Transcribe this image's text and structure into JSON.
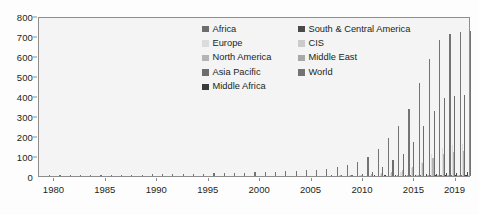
{
  "chart": {
    "type": "bar",
    "background_color": "#f4f4f4",
    "frame_color": "#8d8d8d"
  },
  "axes": {
    "y": {
      "label": "",
      "ticks": [
        "0",
        "100",
        "200",
        "300",
        "400",
        "500",
        "600",
        "700",
        "800"
      ],
      "min": 0,
      "max": 800
    },
    "x": {
      "label": "",
      "ticks": [
        "1980",
        "1985",
        "1990",
        "1995",
        "2000",
        "2005",
        "2010",
        "2015",
        "2019"
      ]
    }
  },
  "legend": {
    "position": "top-center",
    "entries": [
      {
        "label": "Africa",
        "color": "#6d6d6d"
      },
      {
        "label": "Europe",
        "color": "#dcdcdc"
      },
      {
        "label": "North America",
        "color": "#b4b4b4"
      },
      {
        "label": "Asia Pacific",
        "color": "#6d6d6d"
      },
      {
        "label": "Middle Africa",
        "color": "#3a3a3a"
      },
      {
        "label": "South & Central America",
        "color": "#4a4a4a"
      },
      {
        "label": "CIS",
        "color": "#cbcbcb"
      },
      {
        "label": "Middle East",
        "color": "#a8a8a8"
      },
      {
        "label": "World",
        "color": "#737373"
      }
    ]
  },
  "chart_data": {
    "type": "bar",
    "title": "",
    "xlabel": "",
    "ylabel": "",
    "ylim": [
      0,
      800
    ],
    "grid": false,
    "legend_position": "top-center",
    "x": [
      "1979",
      "1980",
      "1981",
      "1982",
      "1983",
      "1984",
      "1985",
      "1986",
      "1987",
      "1988",
      "1989",
      "1990",
      "1991",
      "1992",
      "1993",
      "1994",
      "1995",
      "1996",
      "1997",
      "1998",
      "1999",
      "2000",
      "2001",
      "2002",
      "2003",
      "2004",
      "2005",
      "2006",
      "2007",
      "2008",
      "2009",
      "2010",
      "2011",
      "2012",
      "2013",
      "2014",
      "2015",
      "2016",
      "2017",
      "2018",
      "2019",
      "2020"
    ],
    "categories": [
      "1979",
      "1980",
      "1981",
      "1982",
      "1983",
      "1984",
      "1985",
      "1986",
      "1987",
      "1988",
      "1989",
      "1990",
      "1991",
      "1992",
      "1993",
      "1994",
      "1995",
      "1996",
      "1997",
      "1998",
      "1999",
      "2000",
      "2001",
      "2002",
      "2003",
      "2004",
      "2005",
      "2006",
      "2007",
      "2008",
      "2009",
      "2010",
      "2011",
      "2012",
      "2013",
      "2014",
      "2015",
      "2016",
      "2017",
      "2018",
      "2019",
      "2020"
    ],
    "series": [
      {
        "name": "Africa",
        "color": "#6d6d6d",
        "values": [
          0,
          0,
          0,
          0,
          0,
          0,
          0,
          0,
          0,
          0,
          0,
          0,
          0,
          0,
          0,
          0,
          0,
          0,
          0,
          0,
          0,
          0,
          0,
          0,
          0,
          0,
          0,
          0,
          0,
          0,
          0,
          0,
          0,
          0,
          0,
          0,
          2,
          2,
          3,
          4,
          5,
          5
        ]
      },
      {
        "name": "Europe",
        "color": "#dcdcdc",
        "values": [
          0,
          0,
          0,
          0,
          0,
          0,
          0,
          0,
          0,
          0,
          0,
          0,
          0,
          0,
          0,
          0,
          0,
          0,
          0,
          0,
          0,
          0,
          0,
          0,
          0,
          0,
          0,
          0,
          0,
          1,
          1,
          2,
          4,
          8,
          14,
          22,
          40,
          70,
          110,
          140,
          155,
          160
        ]
      },
      {
        "name": "North America",
        "color": "#b4b4b4",
        "values": [
          0,
          0,
          0,
          0,
          0,
          0,
          0,
          0,
          0,
          0,
          0,
          0,
          0,
          0,
          0,
          0,
          0,
          0,
          0,
          0,
          0,
          0,
          0,
          0,
          0,
          0,
          0,
          0,
          0,
          1,
          2,
          5,
          9,
          14,
          20,
          28,
          45,
          65,
          90,
          110,
          120,
          125
        ]
      },
      {
        "name": "Asia Pacific",
        "color": "#6d6d6d",
        "values": [
          0,
          0,
          0,
          0,
          0,
          0,
          0,
          0,
          0,
          0,
          0,
          0,
          0,
          0,
          0,
          0,
          0,
          0,
          0,
          0,
          0,
          0,
          0,
          0,
          0,
          0,
          0,
          0,
          1,
          2,
          4,
          10,
          22,
          45,
          80,
          110,
          170,
          255,
          330,
          395,
          405,
          410
        ]
      },
      {
        "name": "Middle Africa",
        "color": "#3a3a3a",
        "values": [
          0,
          0,
          0,
          0,
          0,
          0,
          0,
          0,
          0,
          0,
          0,
          0,
          0,
          0,
          0,
          0,
          0,
          0,
          0,
          0,
          0,
          0,
          0,
          0,
          0,
          0,
          0,
          0,
          0,
          0,
          0,
          0,
          0,
          0,
          0,
          0,
          0,
          0,
          1,
          1,
          2,
          2
        ]
      },
      {
        "name": "South & Central America",
        "color": "#4a4a4a",
        "values": [
          0,
          0,
          0,
          0,
          0,
          0,
          0,
          0,
          0,
          0,
          0,
          0,
          0,
          0,
          0,
          0,
          0,
          0,
          0,
          0,
          0,
          0,
          0,
          0,
          0,
          0,
          0,
          0,
          0,
          0,
          0,
          0,
          1,
          2,
          3,
          4,
          6,
          9,
          12,
          15,
          17,
          18
        ]
      },
      {
        "name": "CIS",
        "color": "#cbcbcb",
        "values": [
          0,
          0,
          0,
          0,
          0,
          0,
          0,
          0,
          0,
          0,
          0,
          0,
          0,
          0,
          0,
          0,
          0,
          0,
          0,
          0,
          0,
          0,
          0,
          0,
          0,
          0,
          0,
          0,
          0,
          0,
          0,
          0,
          0,
          0,
          0,
          0,
          1,
          1,
          2,
          2,
          3,
          3
        ]
      },
      {
        "name": "Middle East",
        "color": "#a8a8a8",
        "values": [
          0,
          0,
          0,
          0,
          0,
          0,
          0,
          0,
          0,
          0,
          0,
          0,
          0,
          0,
          0,
          0,
          0,
          0,
          0,
          0,
          0,
          0,
          0,
          0,
          0,
          0,
          0,
          0,
          0,
          0,
          0,
          0,
          0,
          0,
          1,
          1,
          2,
          3,
          4,
          5,
          6,
          7
        ]
      },
      {
        "name": "World",
        "color": "#737373",
        "values": [
          1,
          2,
          2,
          3,
          4,
          4,
          5,
          5,
          6,
          7,
          8,
          9,
          10,
          10,
          11,
          12,
          13,
          14,
          15,
          16,
          18,
          20,
          22,
          24,
          26,
          28,
          32,
          38,
          45,
          55,
          70,
          95,
          135,
          190,
          255,
          340,
          470,
          590,
          690,
          720,
          730,
          735
        ]
      }
    ]
  }
}
